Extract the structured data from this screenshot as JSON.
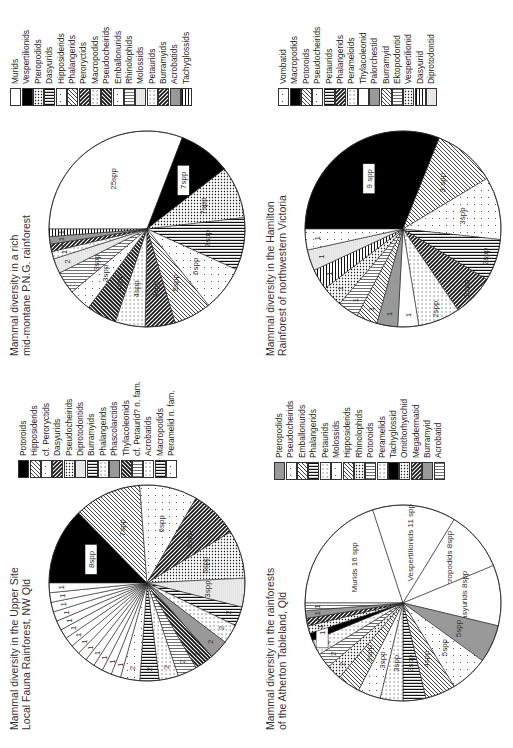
{
  "chart_data": [
    {
      "type": "pie",
      "title": "Mammal diversity in the Upper Site Local Fauna Rainforest, NW Qld",
      "legend": [
        "Potoroids",
        "Hipposiderids",
        "cf. Peroryctids",
        "Dasyurids",
        "Pseudocheirids",
        "Diprotodontids",
        "Burramyids",
        "Phalangerids",
        "Phascolarctids",
        "Thylacoleonids",
        "cf. Petaurid? n. fam.",
        "Acrobatids",
        "Macropodids",
        "Peramelid n. fam."
      ],
      "slices": [
        {
          "family": "Potoroids",
          "value": 8,
          "label": "8spp"
        },
        {
          "family": "Hipposiderids",
          "value": 7,
          "label": "7spp"
        },
        {
          "family": "cf. Peroryctids",
          "value": 6,
          "label": "6spp"
        },
        {
          "family": "Dasyurids",
          "value": 5,
          "label": "5spp"
        },
        {
          "family": "Pseudocheirids",
          "value": 5,
          "label": "5spp"
        },
        {
          "family": "Diprotodontids",
          "value": 3,
          "label": "3spp"
        },
        {
          "family": "Burramyids",
          "value": 2,
          "label": "2"
        },
        {
          "family": "Phalangerids",
          "value": 2,
          "label": "2"
        },
        {
          "family": "Phascolarctids",
          "value": 2,
          "label": "2"
        },
        {
          "family": "Thylacoleonids",
          "value": 2,
          "label": "2"
        },
        {
          "family": "cf. Petaurid? n. fam.",
          "value": 2,
          "label": "2"
        },
        {
          "family": "Acrobatids",
          "value": 2,
          "label": "2"
        },
        {
          "family": "Macropodids",
          "value": 2,
          "label": "2"
        },
        {
          "family": "Peramelid n. fam.",
          "value": 2,
          "label": "2"
        },
        {
          "family": "Thylacinids",
          "value": 1,
          "label": "1"
        },
        {
          "family": "Notoryctids",
          "value": 1,
          "label": "1"
        },
        {
          "family": "cf. Phascolartid n. fam.",
          "value": 1,
          "label": "1"
        },
        {
          "family": "? Wynyardiids",
          "value": 1,
          "label": "1"
        },
        {
          "family": "cf. Vombatid n. fam.",
          "value": 1,
          "label": "1"
        },
        {
          "family": "Pilkipildrids",
          "value": 1,
          "label": "1"
        },
        {
          "family": "cf. Pseudocheirid? n. fam.",
          "value": 1,
          "label": "1"
        },
        {
          "family": "Petaurids",
          "value": 1,
          "label": "1"
        },
        {
          "family": "Yalkaparidontids",
          "value": 1,
          "label": "1"
        },
        {
          "family": "Yingabalanarids",
          "value": 1,
          "label": "1"
        },
        {
          "family": "Megadermatids",
          "value": 1,
          "label": "1"
        },
        {
          "family": "Vespertilionoid",
          "value": 1,
          "label": "1"
        },
        {
          "family": "Molossids",
          "value": 1,
          "label": "1"
        }
      ],
      "callouts": [
        "Megadermatids",
        "Yingabalanarids",
        "Yalkaparidontids",
        "Petaurids",
        "cf. Pseudocheirid? n. fam.",
        "Pilkipildrids",
        "cf. Vombatid n. fam.",
        "? Wynyardiids",
        "cf. Phascolartid n. fam.",
        "Notoryctids",
        "Thylacinids",
        "Vespertilionoid",
        "Molossids"
      ]
    },
    {
      "type": "pie",
      "title": "Mammal diversity in a rich mid-montane P.N.G. rainforest",
      "legend": [
        "Murids",
        "Vespertilionids",
        "Pteropodids",
        "Dasyurids",
        "Hipposiderids",
        "Phalangerids",
        "Peroryctids",
        "Macropodids",
        "Pseudocheirids",
        "Emballonurids",
        "Rhinolophids",
        "Molossids",
        "Petaurids",
        "Burramyids",
        "Acrobatids",
        "Tachyglossids"
      ],
      "slices": [
        {
          "family": "Murids",
          "value": 25,
          "label": "25spp"
        },
        {
          "family": "Vespertilionids",
          "value": 7,
          "label": "7spp"
        },
        {
          "family": "Pteropodids",
          "value": 7,
          "label": "7spp"
        },
        {
          "family": "Dasyurids",
          "value": 7,
          "label": "7spp"
        },
        {
          "family": "Hipposiderids",
          "value": 6,
          "label": "6spp"
        },
        {
          "family": "Phalangerids",
          "value": 5,
          "label": "5spp"
        },
        {
          "family": "Peroryctids",
          "value": 4,
          "label": "4spp"
        },
        {
          "family": "Macropodids",
          "value": 4,
          "label": "4spp"
        },
        {
          "family": "Pseudocheirids",
          "value": 4,
          "label": "4spp"
        },
        {
          "family": "Emballonurids",
          "value": 3,
          "label": "3spp"
        },
        {
          "family": "Rhinolophids",
          "value": 3,
          "label": "3spp"
        },
        {
          "family": "Molossids",
          "value": 2,
          "label": "2"
        },
        {
          "family": "Petaurids",
          "value": 1,
          "label": "1"
        },
        {
          "family": "Burramyids",
          "value": 1,
          "label": "1"
        },
        {
          "family": "Acrobatids",
          "value": 1,
          "label": "1"
        },
        {
          "family": "Tachyglossids",
          "value": 1,
          "label": "1"
        }
      ]
    },
    {
      "type": "pie",
      "title": "Mammal diversity in the rainforests of the Atherton Tableland, Qld",
      "legend": [
        "Pteropodids",
        "Pseudocheirids",
        "Emballonurids",
        "Phalangerids",
        "Petaurids",
        "Molossids",
        "Hipposiderids",
        "Rhinolophids",
        "Potoroids",
        "Peramelids",
        "Tachyglossid",
        "Ornithorhynchid",
        "Megadermatid",
        "Burramyid",
        "Acrobatid"
      ],
      "slices": [
        {
          "family": "Murids",
          "value": 16,
          "label": "Murids 16 spp"
        },
        {
          "family": "Vespertilionids",
          "value": 11,
          "label": "Vespertilionids 11 spp"
        },
        {
          "family": "Macropodids",
          "value": 8,
          "label": "Macropodids 8spp"
        },
        {
          "family": "Dasyurids",
          "value": 8,
          "label": "Dasyurids 8spp"
        },
        {
          "family": "Pteropodids",
          "value": 5,
          "label": "5spp"
        },
        {
          "family": "Pseudocheirids",
          "value": 5,
          "label": "5spp"
        },
        {
          "family": "Emballonurids",
          "value": 4,
          "label": "4spp"
        },
        {
          "family": "Phalangerids",
          "value": 3,
          "label": "3spp"
        },
        {
          "family": "Petaurids",
          "value": 3,
          "label": "3spp"
        },
        {
          "family": "Molossids",
          "value": 3,
          "label": "3spp"
        },
        {
          "family": "Hipposiderids",
          "value": 3,
          "label": "3spp"
        },
        {
          "family": "Rhinolophids",
          "value": 2,
          "label": "2"
        },
        {
          "family": "Potoroids",
          "value": 2,
          "label": "2"
        },
        {
          "family": "Peramelids",
          "value": 2,
          "label": "2"
        },
        {
          "family": "Tachyglossid",
          "value": 1,
          "label": "1"
        },
        {
          "family": "Ornithorhynchid",
          "value": 1,
          "label": "1"
        },
        {
          "family": "Megadermatid",
          "value": 1,
          "label": "1"
        },
        {
          "family": "Burramyid",
          "value": 1,
          "label": "1"
        },
        {
          "family": "Acrobatid",
          "value": 1,
          "label": "1"
        }
      ]
    },
    {
      "type": "pie",
      "title": "Mammal diversity in the Hamilton Rainforest of northwestern Victoria",
      "legend": [
        "Vombatid",
        "Macropodids",
        "Potoroids",
        "Pseudocheirids",
        "Petaurids",
        "Phalangerids",
        "Perameloids",
        "Thylacoleonid",
        "Palorchestid",
        "Burramyid",
        "Ektopodontid",
        "Vespertilionid",
        "Dasyurid",
        "Diprotodontid"
      ],
      "slices": [
        {
          "family": "Macropodids",
          "value": 9,
          "label": "9 spp"
        },
        {
          "family": "Potoroids",
          "value": 3,
          "label": "3 spp"
        },
        {
          "family": "Pseudocheirids",
          "value": 3,
          "label": "3spp"
        },
        {
          "family": "Petaurids",
          "value": 2,
          "label": "2spp"
        },
        {
          "family": "Phalangerids",
          "value": 2,
          "label": "2spp"
        },
        {
          "family": "Perameloids",
          "value": 2,
          "label": "2spp"
        },
        {
          "family": "Thylacoleonid",
          "value": 1,
          "label": "1"
        },
        {
          "family": "Palorchestid",
          "value": 1,
          "label": "1"
        },
        {
          "family": "Burramyid",
          "value": 1,
          "label": "1"
        },
        {
          "family": "Ektopodontid",
          "value": 1,
          "label": "1"
        },
        {
          "family": "Vespertilionid",
          "value": 1,
          "label": "1"
        },
        {
          "family": "Dasyurid",
          "value": 1,
          "label": "1"
        },
        {
          "family": "Diprotodontid",
          "value": 1,
          "label": "1"
        },
        {
          "family": "Vombatid",
          "value": 1,
          "label": "1"
        }
      ]
    }
  ],
  "panels": {
    "upper_site": {
      "title": "Mammal diversity in the Upper Site\nLocal Fauna Rainforest, NW Qld"
    },
    "png": {
      "title": "Mammal diversity in a rich\nmid-montane P.N.G. rainforest"
    },
    "atherton": {
      "title": "Mammal diversity in the rainforests\nof the Atherton Tableland, Qld"
    },
    "hamilton": {
      "title": "Mammal diversity in the Hamilton\nRainforest of northwestern Victoria"
    }
  }
}
